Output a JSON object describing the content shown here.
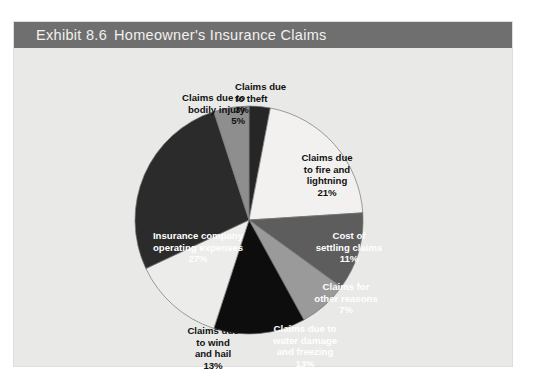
{
  "figure": {
    "exhibit_number": "Exhibit 8.6",
    "title": "Homeowner's Insurance Claims",
    "panel_bg": "#e9e9e7",
    "title_bar_bg": "#6f6f6f",
    "title_color": "#f2f1ef"
  },
  "chart_data": {
    "type": "pie",
    "title": "Homeowner's Insurance Claims",
    "xlabel": "",
    "ylabel": "",
    "legend": "none (slices labeled directly)",
    "grid": false,
    "total_percent": 100,
    "start_angle_deg": 0,
    "direction": "clockwise",
    "slices": [
      {
        "label": "Claims due to theft",
        "label_lines": [
          "Claims due",
          "to theft"
        ],
        "value": 3,
        "value_label": "3%",
        "color": "#262626",
        "text_on": "light"
      },
      {
        "label": "Claims due to fire and lightning",
        "label_lines": [
          "Claims due",
          "to fire and",
          "lightning"
        ],
        "value": 21,
        "value_label": "21%",
        "color": "#f2f1ef",
        "text_on": "light"
      },
      {
        "label": "Cost of settling claims",
        "label_lines": [
          "Cost of",
          "settling claims"
        ],
        "value": 11,
        "value_label": "11%",
        "color": "#5d5d5d",
        "text_on": "dark"
      },
      {
        "label": "Claims for other reasons",
        "label_lines": [
          "Claims for",
          "other reasons"
        ],
        "value": 7,
        "value_label": "7%",
        "color": "#9a9a9a",
        "text_on": "dark"
      },
      {
        "label": "Claims due to water damage and freezing",
        "label_lines": [
          "Claims due to",
          "water damage",
          "and freezing"
        ],
        "value": 13,
        "value_label": "13%",
        "color": "#0d0d0d",
        "text_on": "dark"
      },
      {
        "label": "Claims due to wind and hail",
        "label_lines": [
          "Claims due",
          "to wind",
          "and hail"
        ],
        "value": 13,
        "value_label": "13%",
        "color": "#ececea",
        "text_on": "light"
      },
      {
        "label": "Insurance company operating expenses",
        "label_lines": [
          "Insurance company",
          "operating expenses"
        ],
        "value": 27,
        "value_label": "27%",
        "color": "#2b2b2b",
        "text_on": "dark"
      },
      {
        "label": "Claims due to bodily injury",
        "label_lines": [
          "Claims due to",
          "bodily injury"
        ],
        "value": 5,
        "value_label": "5%",
        "color": "#8e8e8e",
        "text_on": "light"
      }
    ],
    "categories": [
      "Claims due to theft",
      "Claims due to fire and lightning",
      "Cost of settling claims",
      "Claims for other reasons",
      "Claims due to water damage and freezing",
      "Claims due to wind and hail",
      "Insurance company operating expenses",
      "Claims due to bodily injury"
    ],
    "values": [
      3,
      21,
      11,
      7,
      13,
      13,
      27,
      5
    ]
  }
}
